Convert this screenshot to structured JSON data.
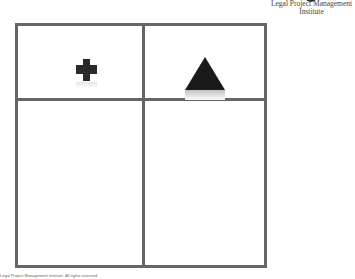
{
  "logo": {
    "line1": "Legal Project Management",
    "line2": "Institute"
  },
  "grid": {
    "rows": 2,
    "cols": 2,
    "cells": [
      {
        "position": "top-left",
        "icon": "plus-icon"
      },
      {
        "position": "top-right",
        "icon": "triangle-icon"
      },
      {
        "position": "bottom-left",
        "icon": null
      },
      {
        "position": "bottom-right",
        "icon": null
      }
    ],
    "border_color": "#666666"
  },
  "footer": {
    "copyright": "Legal Project Management Institute. All rights reserved."
  }
}
